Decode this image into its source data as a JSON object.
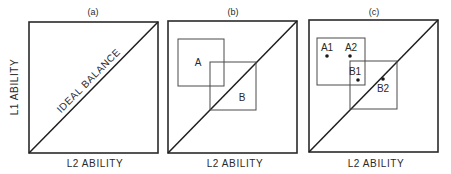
{
  "diagram": {
    "y_axis_label": "L1 ABILITY",
    "panels": [
      {
        "id": "a",
        "panel_label": "(a)",
        "x_axis_label": "L2 ABILITY",
        "diagonal_label": "IDEAL BALANCE",
        "boxes": [],
        "points": []
      },
      {
        "id": "b",
        "panel_label": "(b)",
        "x_axis_label": "L2 ABILITY",
        "boxes": [
          {
            "label": "A"
          },
          {
            "label": "B"
          }
        ],
        "points": []
      },
      {
        "id": "c",
        "panel_label": "(c)",
        "x_axis_label": "L2 ABILITY",
        "boxes": [
          {
            "label": ""
          },
          {
            "label": ""
          }
        ],
        "points": [
          {
            "label": "A1"
          },
          {
            "label": "A2"
          },
          {
            "label": "B1"
          },
          {
            "label": "B2"
          }
        ]
      }
    ]
  }
}
